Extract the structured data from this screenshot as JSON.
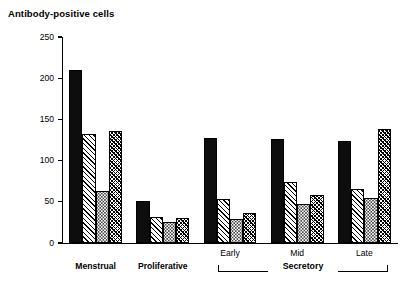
{
  "chart_data": {
    "type": "bar",
    "title": "Antibody-positive cells",
    "xlabel": "",
    "ylabel": "",
    "ylim": [
      0,
      250
    ],
    "yticks": [
      0,
      50,
      100,
      150,
      200,
      250
    ],
    "ytick_labels": [
      "0",
      "50",
      "100",
      "150",
      "200",
      "250"
    ],
    "grid": false,
    "legend": "none",
    "categories": [
      "Menstrual",
      "Proliferative",
      "Early",
      "Mid",
      "Late"
    ],
    "group_bracket": {
      "label": "Secretory",
      "spans": [
        "Early",
        "Mid",
        "Late"
      ]
    },
    "series": [
      {
        "name": "bar-1",
        "pattern": "solid-black",
        "values": [
          210,
          51,
          127,
          126,
          124
        ]
      },
      {
        "name": "bar-2",
        "pattern": "diagonal-hatch",
        "values": [
          132,
          31,
          54,
          74,
          65
        ]
      },
      {
        "name": "bar-3",
        "pattern": "stipple-dots",
        "values": [
          63,
          25,
          29,
          47,
          55
        ]
      },
      {
        "name": "bar-4",
        "pattern": "cross-hatch",
        "values": [
          136,
          30,
          36,
          58,
          138
        ]
      }
    ]
  },
  "axis": {
    "y_label_250": "250",
    "y_label_200": "200",
    "y_label_150": "150",
    "y_label_100": "100",
    "y_label_50": "50",
    "y_label_0": "0"
  },
  "labels": {
    "menstrual": "Menstrual",
    "proliferative": "Proliferative",
    "early": "Early",
    "mid": "Mid",
    "late": "Late",
    "secretory": "Secretory"
  },
  "colors": {
    "ink": "#000000",
    "background": "#ffffff",
    "bar_solid": "#0d0d0d"
  }
}
